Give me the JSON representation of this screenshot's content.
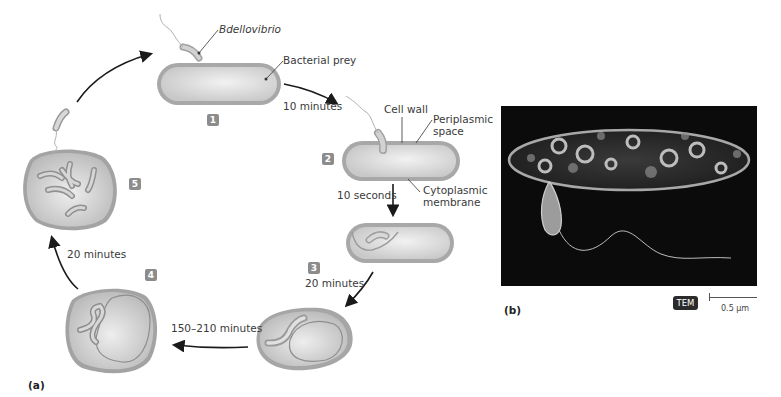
{
  "figure": {
    "panel_a_label": "(a)",
    "panel_b_label": "(b)"
  },
  "cycle": {
    "steps": [
      {
        "number": "1"
      },
      {
        "number": "2"
      },
      {
        "number": "3"
      },
      {
        "number": "4"
      },
      {
        "number": "5"
      }
    ],
    "durations": {
      "step1_to_2": "10 minutes",
      "step2_to_3": "10 seconds",
      "step3_to_next": "20 minutes",
      "step3_to_4": "150–210 minutes",
      "step4_to_5": "20 minutes"
    },
    "annotations": {
      "predator": "Bdellovibrio",
      "prey": "Bacterial prey",
      "cell_wall": "Cell wall",
      "periplasmic_space": "Periplasmic\nspace",
      "cytoplasmic_membrane": "Cytoplasmic\nmembrane"
    }
  },
  "micrograph": {
    "technique_badge": "TEM",
    "scale_label": "0.5 µm"
  },
  "colors": {
    "cell_fill": "#d9d9d9",
    "cell_wall": "#9a9a9a",
    "arrow": "#1a1a1a",
    "badge": "#8c8c8c",
    "tem_background": "#0b0b0b"
  }
}
